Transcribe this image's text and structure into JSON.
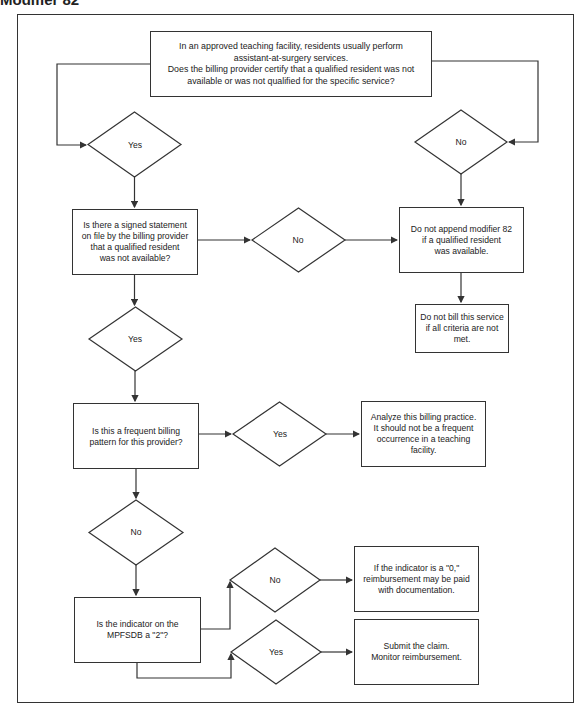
{
  "title": "Modifier 82",
  "nodes": {
    "start": {
      "lines": [
        "In an approved teaching facility, residents usually perform",
        "assistant-at-surgery services.",
        "Does the billing provider certify that a qualified resident was not",
        "available or was not qualified for the specific service?"
      ]
    },
    "decision_start_yes": {
      "label": "Yes"
    },
    "decision_start_no": {
      "label": "No"
    },
    "signed_statement": {
      "lines": [
        "Is there a signed statement",
        "on file by the billing provider",
        "that a qualified resident",
        "was not available?"
      ]
    },
    "decision_signed_no": {
      "label": "No"
    },
    "do_not_append": {
      "lines": [
        "Do not append modifier 82",
        "if a qualified resident",
        "was available."
      ]
    },
    "do_not_bill": {
      "lines": [
        "Do not bill this service",
        "if all criteria are not",
        "met."
      ]
    },
    "decision_signed_yes": {
      "label": "Yes"
    },
    "frequent_billing": {
      "lines": [
        "Is this a frequent billing",
        "pattern for this provider?"
      ]
    },
    "decision_frequent_yes": {
      "label": "Yes"
    },
    "analyze": {
      "lines": [
        "Analyze this billing practice.",
        "It should not be a frequent",
        "occurrence in a teaching",
        "facility."
      ]
    },
    "decision_frequent_no": {
      "label": "No"
    },
    "indicator": {
      "lines": [
        "Is the indicator on the",
        "MPFSDB a \"2\"?"
      ]
    },
    "decision_indicator_no": {
      "label": "No"
    },
    "decision_indicator_yes": {
      "label": "Yes"
    },
    "indicator_zero": {
      "lines": [
        "If the indicator is a \"0,\"",
        "reimbursement may be paid",
        "with documentation."
      ]
    },
    "submit_claim": {
      "lines": [
        "Submit the claim.",
        "Monitor reimbursement."
      ]
    }
  },
  "colors": {
    "line": "#333333",
    "background": "#ffffff",
    "text": "#222222"
  }
}
